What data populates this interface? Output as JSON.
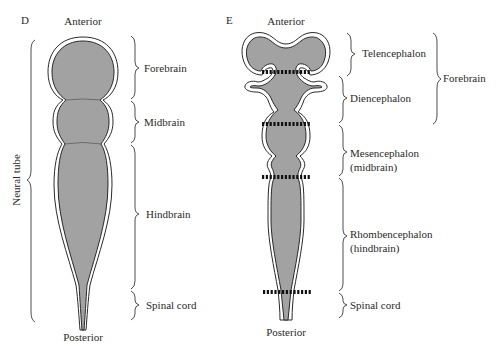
{
  "panel_d": {
    "letter": "D",
    "top_label": "Anterior",
    "bottom_label": "Posterior",
    "side_label": "Neural tube",
    "regions": [
      {
        "label": "Forebrain"
      },
      {
        "label": "Midbrain"
      },
      {
        "label": "Hindbrain"
      },
      {
        "label": "Spinal cord"
      }
    ]
  },
  "panel_e": {
    "letter": "E",
    "top_label": "Anterior",
    "bottom_label": "Posterior",
    "regions": [
      {
        "label": "Telencephalon"
      },
      {
        "label": "Diencephalon"
      },
      {
        "label_line1": "Mesencephalon",
        "label_line2": "(midbrain)"
      },
      {
        "label_line1": "Rhombencephalon",
        "label_line2": "(hindbrain)"
      },
      {
        "label": "Spinal cord"
      }
    ],
    "group_label": "Forebrain"
  },
  "colors": {
    "tissue_fill": "#a2a2a2",
    "outline": "#2a2a2a",
    "boundary_marker": "#111111"
  }
}
